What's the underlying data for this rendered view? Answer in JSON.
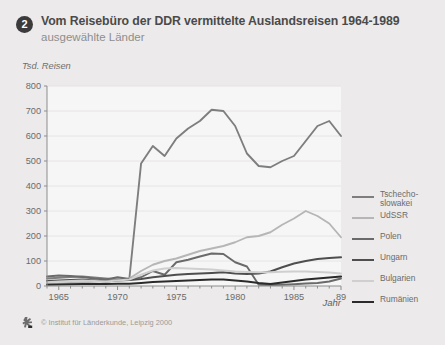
{
  "header": {
    "badge_number": "2",
    "title": "Vom Reisebüro der DDR vermittelte Auslandsreisen 1964-1989",
    "subtitle": "ausgewählte Länder"
  },
  "footer": {
    "credit": "© Institut für Länderkunde, Leipzig 2000",
    "logo_name": "institut-logo"
  },
  "colors": {
    "card_background": "#eceaea",
    "plot_background": "#f7f6f6",
    "axis": "#8d8d8d",
    "grid": "#e3e0e0",
    "text": "#6a6a6a",
    "title": "#4a4a4a",
    "subtitle": "#8e8e8e",
    "badge": "#3b3b3b"
  },
  "chart_data": {
    "type": "line",
    "title": "Vom Reisebüro der DDR vermittelte Auslandsreisen 1964-1989",
    "subtitle": "ausgewählte Länder",
    "ylabel": "Tsd. Reisen",
    "xlabel": "Jahr",
    "ylim": [
      0,
      800
    ],
    "xlim": [
      1964,
      1989
    ],
    "grid": true,
    "legend_position": "right",
    "yticks": [
      0,
      100,
      200,
      300,
      400,
      500,
      600,
      700,
      800
    ],
    "ytick_labels": [
      "0",
      "100",
      "200",
      "300",
      "400",
      "500",
      "600",
      "700",
      "800"
    ],
    "xticks": [
      1965,
      1970,
      1975,
      1980,
      1985,
      1989
    ],
    "xtick_labels": [
      "1965",
      "1970",
      "1975",
      "1980",
      "1985",
      "89"
    ],
    "x": [
      1964,
      1965,
      1966,
      1967,
      1968,
      1969,
      1970,
      1971,
      1972,
      1973,
      1974,
      1975,
      1976,
      1977,
      1978,
      1979,
      1980,
      1981,
      1982,
      1983,
      1984,
      1985,
      1986,
      1987,
      1988,
      1989
    ],
    "series": [
      {
        "name": "Tschechoslowakei",
        "color": "#7e7e7e",
        "width": 1.9,
        "values": [
          30,
          33,
          36,
          38,
          34,
          30,
          26,
          28,
          490,
          560,
          520,
          590,
          630,
          660,
          705,
          700,
          640,
          530,
          480,
          475,
          500,
          520,
          580,
          640,
          660,
          600
        ]
      },
      {
        "name": "UdSSR",
        "color": "#b6b6b6",
        "width": 1.9,
        "values": [
          8,
          10,
          12,
          15,
          17,
          20,
          24,
          30,
          60,
          85,
          100,
          110,
          125,
          140,
          150,
          160,
          175,
          195,
          200,
          215,
          245,
          270,
          300,
          280,
          250,
          195
        ]
      },
      {
        "name": "Polen",
        "color": "#6a6a6a",
        "width": 1.9,
        "values": [
          38,
          42,
          40,
          36,
          30,
          26,
          35,
          28,
          35,
          60,
          45,
          95,
          105,
          118,
          130,
          128,
          95,
          78,
          5,
          4,
          5,
          7,
          10,
          12,
          18,
          30
        ]
      },
      {
        "name": "Ungarn",
        "color": "#4e4e4e",
        "width": 2.1,
        "values": [
          20,
          22,
          24,
          26,
          22,
          18,
          22,
          24,
          28,
          35,
          40,
          45,
          48,
          50,
          52,
          55,
          50,
          48,
          50,
          58,
          75,
          90,
          100,
          108,
          112,
          115
        ]
      },
      {
        "name": "Bulgarien",
        "color": "#cfcfcf",
        "width": 1.9,
        "values": [
          15,
          18,
          20,
          22,
          20,
          18,
          22,
          26,
          45,
          62,
          70,
          72,
          70,
          68,
          66,
          62,
          58,
          56,
          55,
          55,
          57,
          58,
          58,
          56,
          54,
          50
        ]
      },
      {
        "name": "Rumänien",
        "color": "#2b2b2b",
        "width": 2.1,
        "values": [
          5,
          6,
          7,
          8,
          8,
          8,
          9,
          9,
          12,
          16,
          18,
          20,
          22,
          24,
          26,
          26,
          22,
          18,
          12,
          8,
          14,
          20,
          26,
          30,
          34,
          38
        ]
      }
    ]
  },
  "legend": {
    "items": [
      {
        "label": "Tschecho-\nslowakei",
        "color": "#7e7e7e"
      },
      {
        "label": "UdSSR",
        "color": "#b6b6b6"
      },
      {
        "label": "Polen",
        "color": "#6a6a6a"
      },
      {
        "label": "Ungarn",
        "color": "#4e4e4e"
      },
      {
        "label": "Bulgarien",
        "color": "#cfcfcf"
      },
      {
        "label": "Rumänien",
        "color": "#2b2b2b"
      }
    ]
  }
}
